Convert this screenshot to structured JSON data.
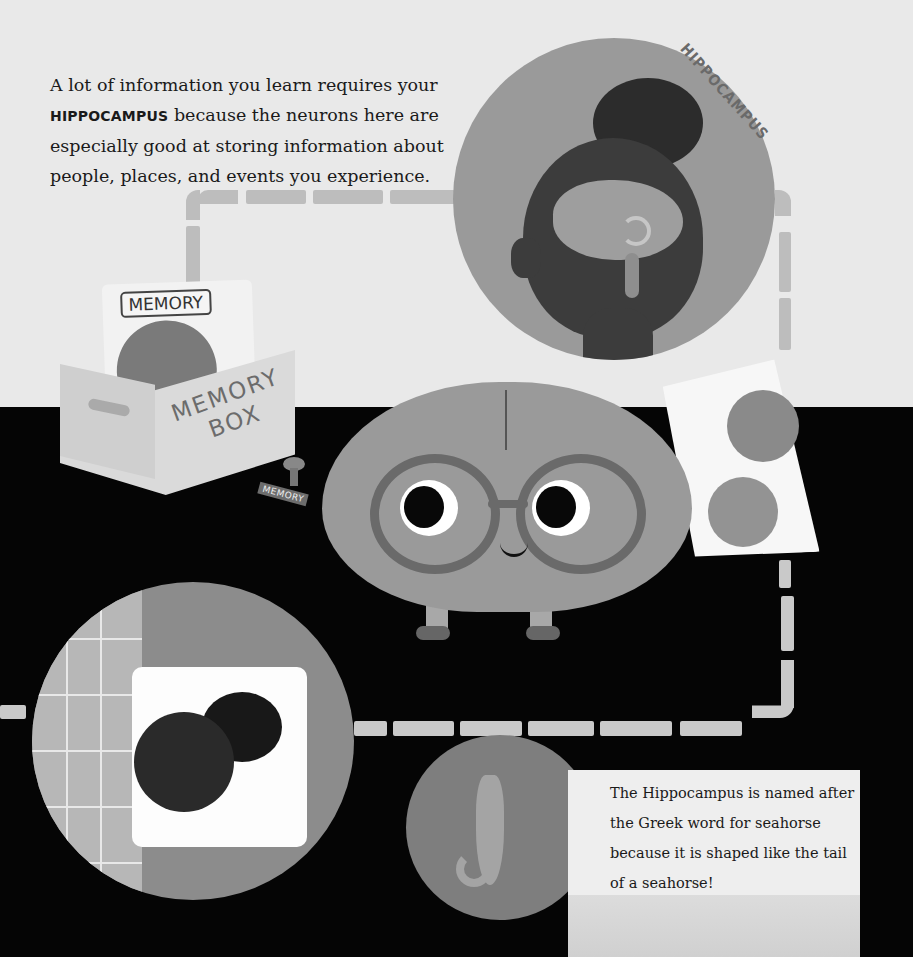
{
  "intro": {
    "line_prefix": "A lot of information you learn requires your ",
    "keyword": "HIPPOCAMPUS",
    "line_suffix": " because the neurons here are especially good at storing information about people, places, and events you experience."
  },
  "hippocampus_label": "HIPPOCAMPUS",
  "memory_box": {
    "card_label": "MEMORY",
    "box_label_line1": "MEMORY",
    "box_label_line2": "BOX"
  },
  "stamp": {
    "label": "MEMORY"
  },
  "fact_box": {
    "text": "The Hippocampus is named after the Greek word for seahorse because it is shaped like the tail of a seahorse!"
  },
  "colors": {
    "top_background": "#e9e9e9",
    "bottom_background": "#050505",
    "track": "#bdbdbd",
    "circle_gray": "#9a9a9a"
  },
  "icons": {
    "head_silhouette": "head-brain-illustration",
    "mascot": "brain-mascot-illustration",
    "memory_box": "memory-box-illustration",
    "photo_card": "photo-card-illustration",
    "sleeping_child": "sleeping-child-illustration",
    "seahorse": "seahorse-illustration"
  }
}
